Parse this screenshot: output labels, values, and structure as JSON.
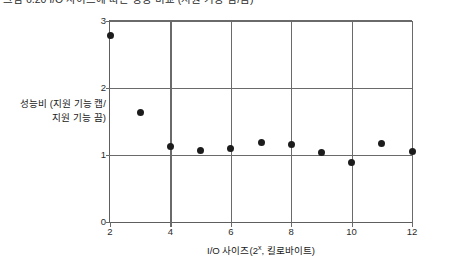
{
  "caption": {
    "text": "그림 6.20  I/O 사이즈에 따른 성능 비교 (지원 기능 켬/끔)"
  },
  "chart_data": {
    "type": "scatter",
    "title": "",
    "xlabel": "I/O 사이즈(2",
    "xlabel_sup": "x",
    "xlabel_tail": ", 킬로바이트)",
    "ylabel_line1": "성능비 (지원 기능 캡/",
    "ylabel_line2": "지원 기능 끔)",
    "xlim": [
      2,
      12
    ],
    "ylim": [
      0,
      3
    ],
    "xticks": [
      "2",
      "4",
      "6",
      "8",
      "10",
      "12"
    ],
    "xtick_values": [
      2,
      4,
      6,
      8,
      10,
      12
    ],
    "yticks": [
      "0",
      "1",
      "2",
      "3"
    ],
    "ytick_values": [
      0,
      1,
      2,
      3
    ],
    "gridlines_h": [
      1,
      2,
      3
    ],
    "gridlines_v": [
      4,
      6,
      8,
      10,
      12
    ],
    "grid": true,
    "legend": "none",
    "marker": "filled-circle",
    "marker_color": "#1c1c1c",
    "axis_color": "#6a6a6a",
    "x": [
      2,
      3,
      4,
      5,
      6,
      7,
      8,
      9,
      10,
      11,
      12
    ],
    "values": [
      2.78,
      1.63,
      1.12,
      1.07,
      1.1,
      1.18,
      1.15,
      1.04,
      0.89,
      1.17,
      1.05
    ]
  }
}
